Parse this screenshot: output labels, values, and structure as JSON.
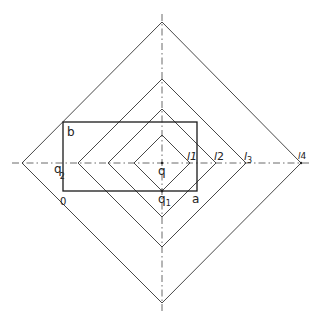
{
  "figure": {
    "type": "geometric-construction",
    "center": {
      "label": "q",
      "x": 162,
      "y": 163
    },
    "axes": {
      "horizontal": {
        "y": 163,
        "x1": 12,
        "x2": 312,
        "style": "dash-dot"
      },
      "vertical": {
        "x": 162,
        "y1": 14,
        "y2": 312,
        "style": "dash-dot"
      }
    },
    "diamonds": [
      {
        "name": "l1",
        "half_width": 28
      },
      {
        "name": "l2",
        "half_width": 54
      },
      {
        "name": "l3",
        "half_width": 84
      },
      {
        "name": "l4",
        "half_width": 139
      }
    ],
    "rectangle": {
      "x": 63,
      "y": 122,
      "width": 134,
      "height": 69
    },
    "labels": {
      "b": "b",
      "q": "q",
      "q1_base": "q",
      "q1_sub": "1",
      "q2_base": "q",
      "q2_sub": "2",
      "a": "a",
      "o": "0",
      "l1": "l1",
      "l2_base": "l",
      "l2_sub": "2",
      "l3_base": "l",
      "l3_sub": "3",
      "l4_base": "l",
      "l4_sub": "4"
    },
    "colors": {
      "line": "#333333",
      "rect": "#1a1a1a",
      "background": "#ffffff"
    }
  }
}
